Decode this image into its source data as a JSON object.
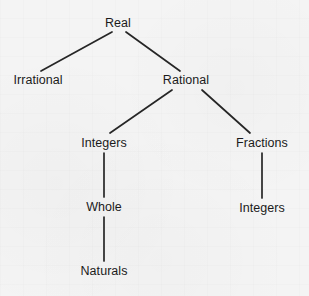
{
  "diagram": {
    "type": "tree",
    "background_color": "#f4f4f4",
    "line_color": "#262626",
    "text_color": "#1b1b1b",
    "nodes": [
      {
        "id": "real",
        "label": "Real",
        "x": 118,
        "y": 23
      },
      {
        "id": "irrational",
        "label": "Irrational",
        "x": 38,
        "y": 80
      },
      {
        "id": "rational",
        "label": "Rational",
        "x": 186,
        "y": 80
      },
      {
        "id": "integers1",
        "label": "Integers",
        "x": 104,
        "y": 143
      },
      {
        "id": "fractions",
        "label": "Fractions",
        "x": 262,
        "y": 143
      },
      {
        "id": "whole",
        "label": "Whole",
        "x": 104,
        "y": 207
      },
      {
        "id": "integers2",
        "label": "Integers",
        "x": 262,
        "y": 208
      },
      {
        "id": "naturals",
        "label": "Naturals",
        "x": 104,
        "y": 271
      }
    ],
    "edges": [
      {
        "id": "real-irrational",
        "from": "real",
        "to": "irrational",
        "x1": 112,
        "y1": 32,
        "x2": 41,
        "y2": 71
      },
      {
        "id": "real-rational",
        "from": "real",
        "to": "rational",
        "x1": 126,
        "y1": 32,
        "x2": 180,
        "y2": 71
      },
      {
        "id": "rational-integers",
        "from": "rational",
        "to": "integers1",
        "x1": 172,
        "y1": 90,
        "x2": 110,
        "y2": 133
      },
      {
        "id": "rational-fractions",
        "from": "rational",
        "to": "fractions",
        "x1": 202,
        "y1": 90,
        "x2": 250,
        "y2": 133
      },
      {
        "id": "integers-whole",
        "from": "integers1",
        "to": "whole",
        "x1": 104,
        "y1": 153,
        "x2": 104,
        "y2": 197
      },
      {
        "id": "fractions-integers",
        "from": "fractions",
        "to": "integers2",
        "x1": 262,
        "y1": 153,
        "x2": 262,
        "y2": 198
      },
      {
        "id": "whole-naturals",
        "from": "whole",
        "to": "naturals",
        "x1": 104,
        "y1": 217,
        "x2": 104,
        "y2": 261
      }
    ]
  }
}
